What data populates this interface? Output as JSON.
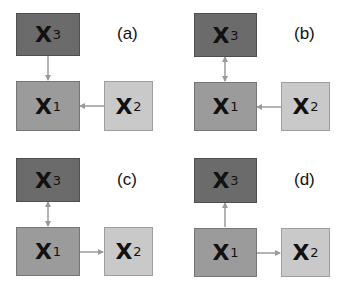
{
  "colors": {
    "x3": "#6b6b6b",
    "x1": "#9b9b9b",
    "x2": "#c9c9c9",
    "arrow": "#9a9a9a"
  },
  "panels": [
    {
      "label": "(a)",
      "nodes": {
        "x3": {
          "var": "X",
          "sub": "3"
        },
        "x1": {
          "var": "X",
          "sub": "1"
        },
        "x2": {
          "var": "X",
          "sub": "2"
        }
      },
      "edges": [
        "X3 → X1",
        "X2 → X1"
      ]
    },
    {
      "label": "(b)",
      "nodes": {
        "x3": {
          "var": "X",
          "sub": "3"
        },
        "x1": {
          "var": "X",
          "sub": "1"
        },
        "x2": {
          "var": "X",
          "sub": "2"
        }
      },
      "edges": [
        "X3 ↔ X1",
        "X2 → X1"
      ]
    },
    {
      "label": "(c)",
      "nodes": {
        "x3": {
          "var": "X",
          "sub": "3"
        },
        "x1": {
          "var": "X",
          "sub": "1"
        },
        "x2": {
          "var": "X",
          "sub": "2"
        }
      },
      "edges": [
        "X3 ↔ X1",
        "X1 → X2"
      ]
    },
    {
      "label": "(d)",
      "nodes": {
        "x3": {
          "var": "X",
          "sub": "3"
        },
        "x1": {
          "var": "X",
          "sub": "1"
        },
        "x2": {
          "var": "X",
          "sub": "2"
        }
      },
      "edges": [
        "X1 → X3",
        "X1 → X2"
      ]
    }
  ]
}
